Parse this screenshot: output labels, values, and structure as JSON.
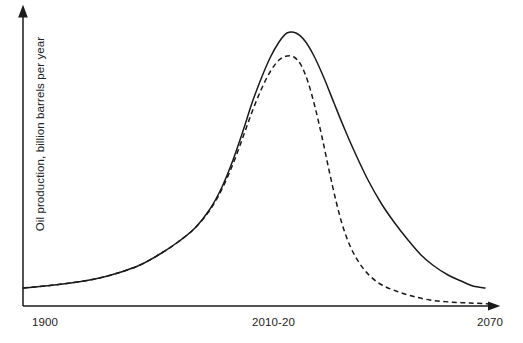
{
  "chart_data": {
    "type": "line",
    "title": "",
    "subtitle": "",
    "xlabel": "",
    "ylabel": "Oil production, billion barrels per year",
    "xticklabels": [
      "1900",
      "2010-20",
      "2070"
    ],
    "xtick_positions_px": [
      23,
      279,
      495
    ],
    "yticklabels": [],
    "grid": false,
    "legend": "none",
    "axis_color": "#1a1a1a",
    "series": [
      {
        "name": "Gradual decline scenario",
        "style": "solid",
        "color": "#1a1a1a",
        "description": "Hubbert-style peak oil curve peaking around 2010-20 with a slow symmetric-leaning decline through 2070",
        "points": [
          [
            23,
            288
          ],
          [
            45,
            286
          ],
          [
            70,
            283
          ],
          [
            95,
            279
          ],
          [
            118,
            273
          ],
          [
            140,
            265
          ],
          [
            160,
            254
          ],
          [
            178,
            242
          ],
          [
            195,
            228
          ],
          [
            210,
            209
          ],
          [
            222,
            187
          ],
          [
            233,
            160
          ],
          [
            243,
            131
          ],
          [
            252,
            103
          ],
          [
            261,
            79
          ],
          [
            270,
            58
          ],
          [
            279,
            42
          ],
          [
            287,
            33
          ],
          [
            296,
            33
          ],
          [
            305,
            41
          ],
          [
            314,
            56
          ],
          [
            324,
            78
          ],
          [
            334,
            103
          ],
          [
            345,
            130
          ],
          [
            356,
            155
          ],
          [
            368,
            180
          ],
          [
            381,
            203
          ],
          [
            394,
            222
          ],
          [
            408,
            240
          ],
          [
            421,
            255
          ],
          [
            434,
            266
          ],
          [
            448,
            275
          ],
          [
            461,
            281
          ],
          [
            473,
            286
          ],
          [
            485,
            288
          ]
        ]
      },
      {
        "name": "Rapid decline scenario",
        "style": "dashed",
        "color": "#1a1a1a",
        "description": "Same rise but a lower peak and much steeper collapse immediately after the peak, flattening near zero before 2070",
        "points": [
          [
            23,
            288
          ],
          [
            45,
            286
          ],
          [
            70,
            283
          ],
          [
            95,
            279
          ],
          [
            118,
            273
          ],
          [
            140,
            265
          ],
          [
            160,
            254
          ],
          [
            178,
            242
          ],
          [
            195,
            228
          ],
          [
            210,
            210
          ],
          [
            222,
            189
          ],
          [
            233,
            164
          ],
          [
            243,
            137
          ],
          [
            252,
            112
          ],
          [
            261,
            90
          ],
          [
            270,
            72
          ],
          [
            279,
            60
          ],
          [
            287,
            56
          ],
          [
            294,
            57
          ],
          [
            301,
            65
          ],
          [
            308,
            82
          ],
          [
            315,
            107
          ],
          [
            322,
            137
          ],
          [
            329,
            170
          ],
          [
            336,
            201
          ],
          [
            343,
            227
          ],
          [
            351,
            248
          ],
          [
            360,
            264
          ],
          [
            370,
            276
          ],
          [
            382,
            285
          ],
          [
            396,
            291
          ],
          [
            412,
            296
          ],
          [
            430,
            300
          ],
          [
            450,
            302
          ],
          [
            470,
            303
          ],
          [
            490,
            304
          ]
        ]
      }
    ],
    "annotations": [],
    "axis_arrows": {
      "x_arrow_end_px": [
        497,
        306
      ],
      "y_arrow_end_px": [
        23,
        10
      ]
    }
  },
  "axes": {
    "x_tick_1900": "1900",
    "x_tick_mid": "2010-20",
    "x_tick_2070": "2070",
    "y_axis_label": "Oil production, billion barrels per year"
  }
}
